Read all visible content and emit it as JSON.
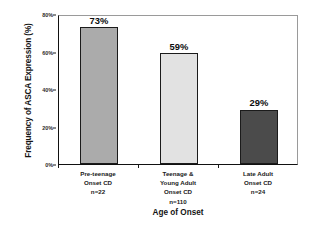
{
  "chart_data": {
    "type": "bar",
    "title": "",
    "xlabel": "Age of Onset",
    "ylabel": "Frequency of ASCA Expression (%)",
    "ylim": [
      0,
      80
    ],
    "yticks": [
      "0%",
      "20%",
      "40%",
      "60%",
      "80%"
    ],
    "ytick_values": [
      0,
      20,
      40,
      60,
      80
    ],
    "grid": false,
    "legend": "none",
    "categories": [
      "Pre-teenage Onset CD",
      "Teenage & Young Adult Onset CD",
      "Late Adult Onset CD"
    ],
    "category_lines": [
      [
        "Pre-teenage",
        "Onset CD",
        "n=22"
      ],
      [
        "Teenage &",
        "Young Adult",
        "Onset CD",
        "n=110"
      ],
      [
        "Late Adult",
        "Onset CD",
        "n=24"
      ]
    ],
    "values": [
      73,
      59,
      29
    ],
    "value_labels": [
      "73%",
      "59%",
      "29%"
    ],
    "sample_sizes": [
      "n=22",
      "n=110",
      "n=24"
    ],
    "bar_colors": [
      "#ABABAB",
      "#E2E2E2",
      "#4B4B4B"
    ],
    "bar_edge_color": "#1B1B1B"
  }
}
